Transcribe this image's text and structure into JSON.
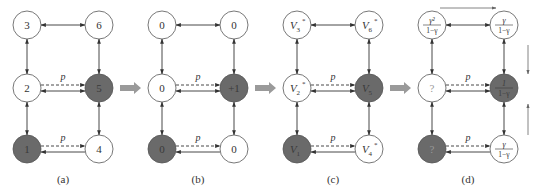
{
  "figure": {
    "colors": {
      "node_fill_white": "#ffffff",
      "node_fill_dark": "#6a6a6a",
      "node_stroke": "#555555",
      "edge": "#333333",
      "transition_arrow": "#9a9a9a",
      "text": "#333333",
      "text_on_dark": "#3a3a3a"
    },
    "edge_label": "p",
    "panels": [
      {
        "caption": "(a)",
        "nodes": {
          "n3": {
            "label": "3",
            "dark": false
          },
          "n6": {
            "label": "6",
            "dark": false
          },
          "n2": {
            "label": "2",
            "dark": false
          },
          "n5": {
            "label": "5",
            "dark": true
          },
          "n1": {
            "label": "1",
            "dark": true
          },
          "n4": {
            "label": "4",
            "dark": false
          }
        }
      },
      {
        "caption": "(b)",
        "nodes": {
          "n3": {
            "label": "0",
            "dark": false
          },
          "n6": {
            "label": "0",
            "dark": false
          },
          "n2": {
            "label": "0",
            "dark": false
          },
          "n5": {
            "label": "+1",
            "dark": true
          },
          "n1": {
            "label": "0",
            "dark": true
          },
          "n4": {
            "label": "0",
            "dark": false
          }
        }
      },
      {
        "caption": "(c)",
        "nodes": {
          "n3": {
            "label": "V",
            "sub": "3",
            "sup": "*",
            "dark": false
          },
          "n6": {
            "label": "V",
            "sub": "6",
            "sup": "*",
            "dark": false
          },
          "n2": {
            "label": "V",
            "sub": "2",
            "sup": "*",
            "dark": false
          },
          "n5": {
            "label": "V",
            "sub": "5",
            "sup": "",
            "dark": true
          },
          "n1": {
            "label": "V",
            "sub": "1",
            "sup": "",
            "dark": true
          },
          "n4": {
            "label": "V",
            "sub": "4",
            "sup": "*",
            "dark": false
          }
        }
      },
      {
        "caption": "(d)",
        "nodes": {
          "n3": {
            "num": "γ²",
            "den": "1−γ",
            "dark": false
          },
          "n6": {
            "num": "γ",
            "den": "1−γ",
            "dark": false
          },
          "n2": {
            "label": "?",
            "dark": false
          },
          "n5": {
            "num": "1",
            "den": "1−γ",
            "dark": true
          },
          "n1": {
            "label": "?",
            "dark": true
          },
          "n4": {
            "num": "γ",
            "den": "1−γ",
            "dark": false
          }
        }
      }
    ],
    "transition_arrows": [
      "a-to-b",
      "b-to-c",
      "c-to-d"
    ]
  }
}
